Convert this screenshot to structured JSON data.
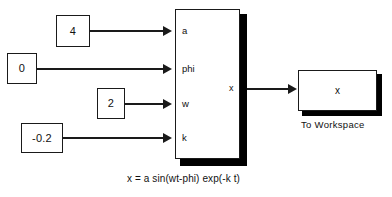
{
  "diagram": {
    "equation": "x = a sin(wt-phi) exp(-k t)",
    "sources": [
      {
        "value": "4",
        "port": "a"
      },
      {
        "value": "0",
        "port": "phi"
      },
      {
        "value": "2",
        "port": "w"
      },
      {
        "value": "-0.2",
        "port": "k"
      }
    ],
    "subsystem": {
      "input_ports": [
        "a",
        "phi",
        "w",
        "k"
      ],
      "output_port": "x"
    },
    "sink": {
      "variable": "x",
      "label": "To Workspace"
    }
  },
  "colors": {
    "line": "#1a1a1a",
    "shadow": "#000000",
    "background": "#ffffff",
    "text": "#111111"
  }
}
